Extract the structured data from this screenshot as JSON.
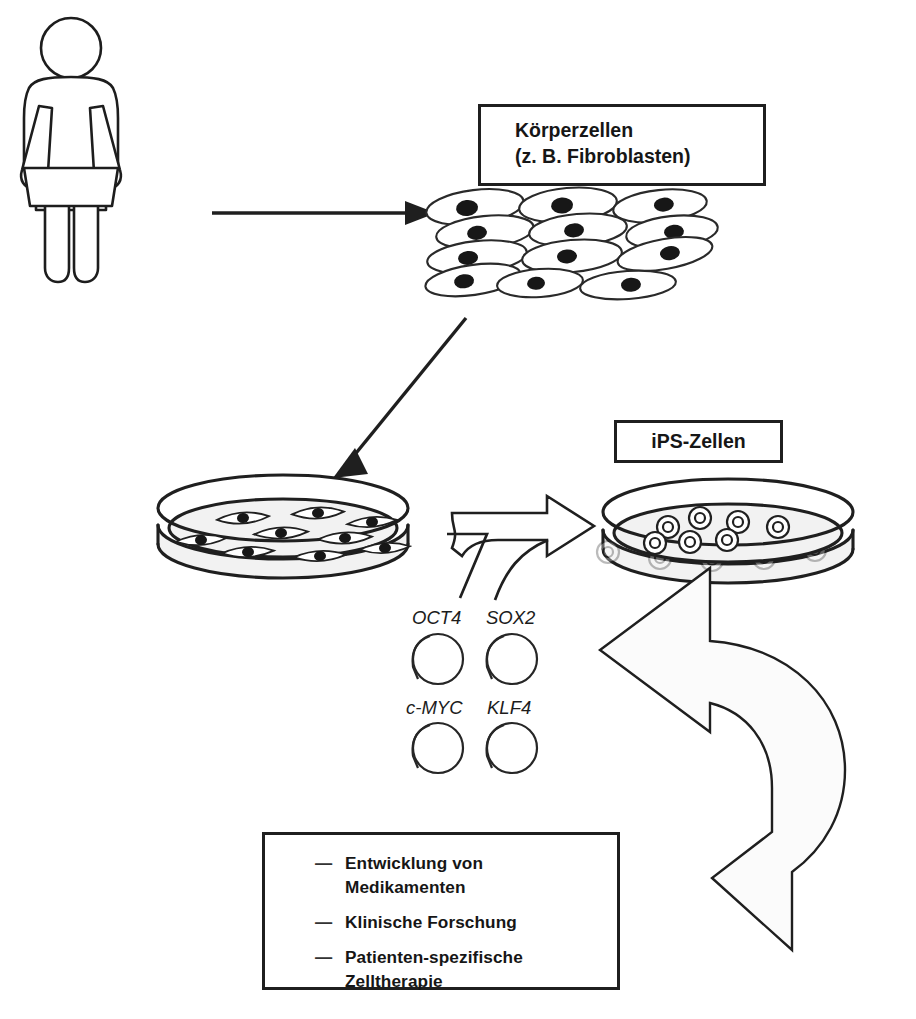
{
  "figure": {
    "language": "de",
    "style": "black-and-white line drawing"
  },
  "boxes": {
    "koerperzellen": {
      "line1": "Körperzellen",
      "line2": "(z. B. Fibroblasten)"
    },
    "ips": {
      "label": "iPS-Zellen"
    },
    "applications": {
      "dash": "—",
      "items": [
        {
          "line1": "Entwicklung von",
          "line2": "Medikamenten"
        },
        {
          "line1": "Klinische Forschung",
          "line2": ""
        },
        {
          "line1": "Patienten-spezifische",
          "line2": "Zelltherapie"
        }
      ]
    }
  },
  "genes": {
    "items": [
      {
        "name": "OCT4"
      },
      {
        "name": "SOX2"
      },
      {
        "name": "c-MYC"
      },
      {
        "name": "KLF4"
      }
    ]
  },
  "stages": {
    "person": "weibliche Figur (Patientin)",
    "cell_sheet": "Körperzellen-Verband",
    "dish_fibroblasts": "Petrischale mit Fibroblasten",
    "dish_ips": "Petrischale mit iPS-Zellen"
  },
  "arrows": {
    "person_to_cells": "Pfeil nach rechts",
    "cells_to_dish": "Pfeil nach unten links",
    "dish_to_ips": "Blockpfeil nach rechts (Reprogrammierung)",
    "gene_feed": "gebogener Pfeil von den Genen",
    "ips_to_applications": "großer gebogener Pfeil nach unten links"
  },
  "bottom_cropped_text": "",
  "colors": {
    "ink": "#1f1f1f",
    "paper": "#ffffff",
    "fill_light": "#f2f2f2"
  }
}
